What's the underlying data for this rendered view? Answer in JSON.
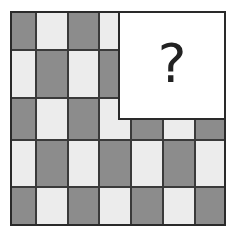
{
  "puzzle": {
    "type": "pattern-completion",
    "grid": {
      "rows": 5,
      "cols": 7,
      "col_edges": [
        0,
        26,
        58,
        89,
        121,
        153,
        185,
        216
      ],
      "row_edges": [
        0,
        39,
        87,
        129,
        176,
        215
      ],
      "pattern": "checkerboard",
      "rule": "dark when (row+col) is even"
    },
    "colors": {
      "dark": "#8c8c8c",
      "light": "#ececec",
      "line": "#2a2a2a"
    },
    "missing_region": {
      "label": "?",
      "left": 108,
      "top": 0,
      "width": 108,
      "height": 109
    }
  }
}
